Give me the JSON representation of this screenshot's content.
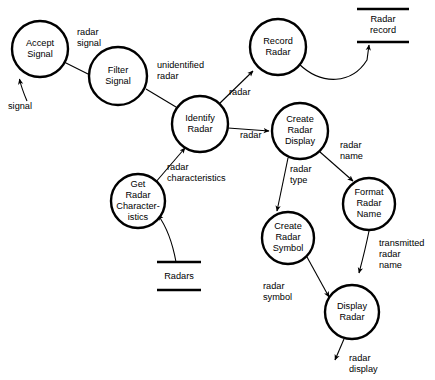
{
  "diagram": {
    "type": "data-flow-diagram",
    "processes": [
      {
        "id": "accept-signal",
        "lines": [
          "Accept",
          "Signal"
        ],
        "cx": 40,
        "cy": 49,
        "r": 28
      },
      {
        "id": "filter-signal",
        "lines": [
          "Filter",
          "Signal"
        ],
        "cx": 118,
        "cy": 76,
        "r": 29
      },
      {
        "id": "identify-radar",
        "lines": [
          "Identify",
          "Radar"
        ],
        "cx": 200,
        "cy": 124,
        "r": 28
      },
      {
        "id": "record-radar",
        "lines": [
          "Record",
          "Radar"
        ],
        "cx": 278,
        "cy": 47,
        "r": 28
      },
      {
        "id": "get-radar-characteristics",
        "lines": [
          "Get",
          "Radar",
          "Character-",
          "istics"
        ],
        "cx": 138,
        "cy": 201,
        "r": 27
      },
      {
        "id": "create-radar-display",
        "lines": [
          "Create",
          "Radar",
          "Display"
        ],
        "cx": 300,
        "cy": 131,
        "r": 28
      },
      {
        "id": "format-radar-name",
        "lines": [
          "Format",
          "Radar",
          "Name"
        ],
        "cx": 369,
        "cy": 204,
        "r": 26
      },
      {
        "id": "create-radar-symbol",
        "lines": [
          "Create",
          "Radar",
          "Symbol"
        ],
        "cx": 288,
        "cy": 238,
        "r": 26
      },
      {
        "id": "display-radar",
        "lines": [
          "Display",
          "Radar"
        ],
        "cx": 352,
        "cy": 312,
        "r": 27
      }
    ],
    "stores": [
      {
        "id": "radar-record-store",
        "lines": [
          "Radar",
          "record"
        ],
        "x1": 357,
        "x2": 409,
        "yTop": 9,
        "yBottom": 42
      },
      {
        "id": "radars-store",
        "lines": [
          "Radars"
        ],
        "x1": 157,
        "x2": 201,
        "yTop": 262,
        "yBottom": 290
      }
    ],
    "flows": [
      {
        "id": "signal-in",
        "label_lines": [
          "signal"
        ],
        "from": "external",
        "to": "accept-signal"
      },
      {
        "id": "radar-signal",
        "label_lines": [
          "radar",
          "signal"
        ],
        "from": "accept-signal",
        "to": "filter-signal"
      },
      {
        "id": "unidentified-radar",
        "label_lines": [
          "unidentified",
          "radar"
        ],
        "from": "filter-signal",
        "to": "identify-radar"
      },
      {
        "id": "radar-to-record",
        "label_lines": [
          "radar"
        ],
        "from": "identify-radar",
        "to": "record-radar"
      },
      {
        "id": "radar-record-write",
        "label_lines": [],
        "from": "record-radar",
        "to": "radar-record-store"
      },
      {
        "id": "radar-to-display",
        "label_lines": [
          "radar"
        ],
        "from": "identify-radar",
        "to": "create-radar-display"
      },
      {
        "id": "radar-characteristics",
        "label_lines": [
          "radar",
          "characteristics"
        ],
        "from": "get-radar-characteristics",
        "to": "identify-radar"
      },
      {
        "id": "radars-read",
        "label_lines": [],
        "from": "radars-store",
        "to": "get-radar-characteristics"
      },
      {
        "id": "radar-name",
        "label_lines": [
          "radar",
          "name"
        ],
        "from": "create-radar-display",
        "to": "format-radar-name"
      },
      {
        "id": "radar-type",
        "label_lines": [
          "radar",
          "type"
        ],
        "from": "create-radar-display",
        "to": "create-radar-symbol"
      },
      {
        "id": "transmitted-radar-name",
        "label_lines": [
          "transmitted",
          "radar",
          "name"
        ],
        "from": "format-radar-name",
        "to": "display-radar"
      },
      {
        "id": "radar-symbol",
        "label_lines": [
          "radar",
          "symbol"
        ],
        "from": "create-radar-symbol",
        "to": "display-radar"
      },
      {
        "id": "radar-display-out",
        "label_lines": [
          "radar",
          "display"
        ],
        "from": "display-radar",
        "to": "external"
      }
    ],
    "labels": {
      "signal": [
        "signal"
      ],
      "radar_signal": [
        "radar",
        "signal"
      ],
      "unidentified_radar": [
        "unidentified",
        "radar"
      ],
      "radar_to_record": [
        "radar"
      ],
      "radar_to_display": [
        "radar"
      ],
      "radar_characteristics": [
        "radar",
        "characteristics"
      ],
      "radar_name": [
        "radar",
        "name"
      ],
      "radar_type": [
        "radar",
        "type"
      ],
      "transmitted_radar_name": [
        "transmitted",
        "radar",
        "name"
      ],
      "radar_symbol": [
        "radar",
        "symbol"
      ],
      "radar_display": [
        "radar",
        "display"
      ]
    },
    "colors": {
      "background": "#ffffff",
      "stroke": "#000000",
      "text": "#000000"
    }
  }
}
